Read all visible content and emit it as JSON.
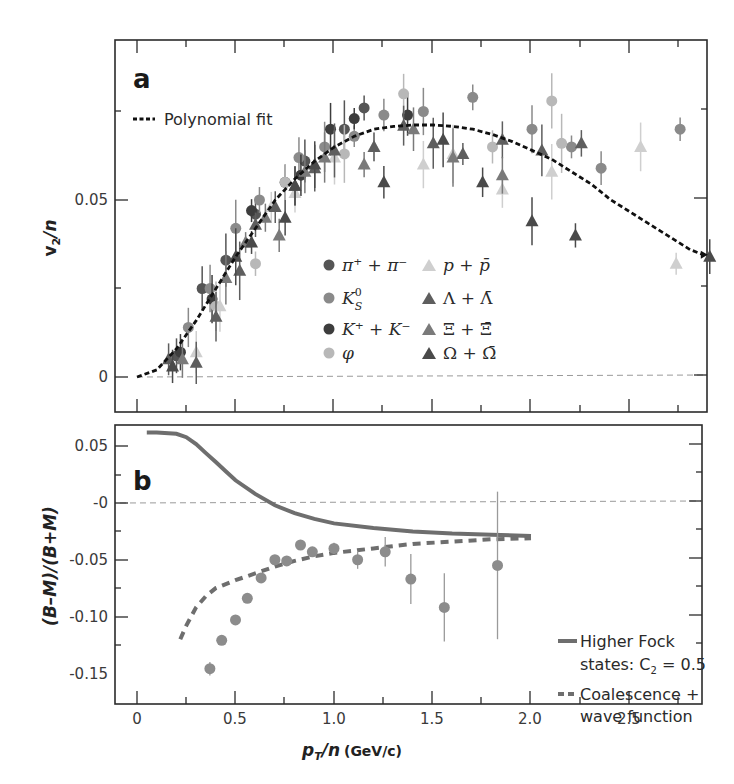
{
  "chart_data": [
    {
      "panel": "a",
      "type": "scatter",
      "xlabel": "p_T/n (GeV/c)",
      "ylabel": "v_2/n",
      "xlim": [
        -0.1,
        2.9
      ],
      "ylim": [
        -0.01,
        0.09
      ],
      "xticks": [
        0,
        0.5,
        1.0,
        1.5,
        2.0,
        2.5
      ],
      "yticks": [
        0,
        0.05
      ],
      "ytick_labels": [
        "0",
        "0.05"
      ],
      "zero_line": true,
      "fit": {
        "name": "Polynomial fit",
        "style": "dotted-black",
        "x": [
          0.0,
          0.1,
          0.2,
          0.3,
          0.4,
          0.5,
          0.6,
          0.7,
          0.8,
          0.9,
          1.0,
          1.1,
          1.2,
          1.3,
          1.4,
          1.5,
          1.6,
          1.7,
          1.8,
          1.9,
          2.0,
          2.1,
          2.2,
          2.3,
          2.4,
          2.5,
          2.6,
          2.7,
          2.8,
          2.87
        ],
        "y": [
          0.0,
          0.002,
          0.008,
          0.016,
          0.025,
          0.034,
          0.042,
          0.05,
          0.056,
          0.061,
          0.065,
          0.068,
          0.07,
          0.0708,
          0.0712,
          0.0712,
          0.0708,
          0.07,
          0.0685,
          0.0665,
          0.064,
          0.0615,
          0.058,
          0.0545,
          0.05,
          0.0465,
          0.043,
          0.0395,
          0.036,
          0.0345
        ]
      },
      "series": [
        {
          "name": "π+ + π−",
          "marker": "circle",
          "color": "#555555",
          "points": [
            [
              0.2,
              0.006
            ],
            [
              0.33,
              0.025
            ],
            [
              0.45,
              0.033
            ],
            [
              0.6,
              0.046
            ],
            [
              0.75,
              0.055
            ],
            [
              0.85,
              0.061
            ],
            [
              1.05,
              0.07
            ],
            [
              1.15,
              0.076
            ]
          ]
        },
        {
          "name": "K0S",
          "marker": "circle",
          "color": "#8a8a8a",
          "points": [
            [
              0.26,
              0.014
            ],
            [
              0.37,
              0.025
            ],
            [
              0.5,
              0.042
            ],
            [
              0.62,
              0.05
            ],
            [
              0.82,
              0.062
            ],
            [
              0.95,
              0.065
            ],
            [
              1.1,
              0.068
            ],
            [
              1.25,
              0.074
            ],
            [
              1.45,
              0.075
            ],
            [
              1.7,
              0.079
            ],
            [
              2.0,
              0.07
            ],
            [
              2.2,
              0.065
            ],
            [
              2.35,
              0.059
            ],
            [
              2.75,
              0.07
            ]
          ]
        },
        {
          "name": "K+ + K−",
          "marker": "circle",
          "color": "#3d3d3d",
          "points": [
            [
              0.22,
              0.007
            ],
            [
              0.38,
              0.022
            ],
            [
              0.58,
              0.047
            ],
            [
              0.83,
              0.057
            ],
            [
              0.98,
              0.07
            ],
            [
              1.1,
              0.073
            ],
            [
              1.37,
              0.074
            ]
          ]
        },
        {
          "name": "φ",
          "marker": "circle",
          "color": "#b8b8b8",
          "points": [
            [
              0.4,
              0.02
            ],
            [
              0.6,
              0.032
            ],
            [
              0.75,
              0.055
            ],
            [
              1.05,
              0.063
            ],
            [
              1.35,
              0.08
            ],
            [
              1.8,
              0.065
            ],
            [
              2.1,
              0.078
            ],
            [
              2.15,
              0.066
            ]
          ]
        },
        {
          "name": "p + p̄",
          "marker": "triangle",
          "color": "#cfcfcf",
          "points": [
            [
              0.3,
              0.007
            ],
            [
              0.42,
              0.02
            ],
            [
              0.68,
              0.048
            ],
            [
              0.8,
              0.052
            ],
            [
              1.0,
              0.062
            ],
            [
              1.2,
              0.065
            ],
            [
              1.45,
              0.06
            ],
            [
              1.6,
              0.063
            ],
            [
              1.85,
              0.053
            ],
            [
              2.1,
              0.058
            ],
            [
              2.55,
              0.065
            ],
            [
              2.73,
              0.032
            ]
          ]
        },
        {
          "name": "Λ + Λ̄",
          "marker": "triangle",
          "color": "#5e5e5e",
          "points": [
            [
              0.16,
              0.005
            ],
            [
              0.3,
              0.004
            ],
            [
              0.4,
              0.017
            ],
            [
              0.52,
              0.03
            ],
            [
              0.6,
              0.043
            ],
            [
              0.7,
              0.048
            ],
            [
              0.8,
              0.054
            ],
            [
              0.9,
              0.059
            ],
            [
              1.0,
              0.064
            ],
            [
              1.2,
              0.065
            ],
            [
              1.35,
              0.071
            ],
            [
              1.5,
              0.066
            ],
            [
              1.65,
              0.063
            ],
            [
              1.85,
              0.067
            ],
            [
              2.05,
              0.064
            ],
            [
              2.25,
              0.066
            ]
          ]
        },
        {
          "name": "Ξ + Ξ̄",
          "marker": "triangle",
          "color": "#7a7a7a",
          "points": [
            [
              0.23,
              0.005
            ],
            [
              0.45,
              0.028
            ],
            [
              0.55,
              0.038
            ],
            [
              0.65,
              0.045
            ],
            [
              0.72,
              0.04
            ],
            [
              0.85,
              0.058
            ],
            [
              0.95,
              0.062
            ],
            [
              1.15,
              0.06
            ],
            [
              1.4,
              0.07
            ],
            [
              1.6,
              0.062
            ],
            [
              1.85,
              0.057
            ]
          ]
        },
        {
          "name": "Ω + Ω̄",
          "marker": "triangle",
          "color": "#4a4a4a",
          "points": [
            [
              0.18,
              0.003
            ],
            [
              0.5,
              0.034
            ],
            [
              0.58,
              0.038
            ],
            [
              0.75,
              0.045
            ],
            [
              0.8,
              0.054
            ],
            [
              0.9,
              0.06
            ],
            [
              1.25,
              0.055
            ],
            [
              1.55,
              0.067
            ],
            [
              1.75,
              0.055
            ],
            [
              2.0,
              0.044
            ],
            [
              2.22,
              0.04
            ],
            [
              2.9,
              0.034
            ]
          ]
        }
      ]
    },
    {
      "panel": "b",
      "type": "scatter",
      "xlabel": "p_T/n (GeV/c)",
      "ylabel": "(B−M)/(B+M)",
      "xlim": [
        -0.1,
        2.9
      ],
      "ylim": [
        -0.15,
        0.065
      ],
      "xticks": [
        0,
        0.5,
        1.0,
        1.5,
        2.0,
        2.5
      ],
      "xtick_labels": [
        "0",
        "0.5",
        "1.0",
        "1.5",
        "2.0",
        "2.5"
      ],
      "yticks": [
        0.05,
        0,
        -0.05,
        -0.1,
        -0.15
      ],
      "ytick_labels": [
        "0.05",
        "-0",
        "-0.05",
        "-0.10",
        "-0.15"
      ],
      "zero_line": true,
      "data": {
        "marker": "circle",
        "color": "#8c8c8c",
        "points": [
          {
            "x": 0.37,
            "y": -0.146,
            "err": 0.006
          },
          {
            "x": 0.43,
            "y": -0.121,
            "err": 0.004
          },
          {
            "x": 0.5,
            "y": -0.103,
            "err": 0.002
          },
          {
            "x": 0.56,
            "y": -0.084,
            "err": 0.002
          },
          {
            "x": 0.63,
            "y": -0.066,
            "err": 0.002
          },
          {
            "x": 0.7,
            "y": -0.05,
            "err": 0.002
          },
          {
            "x": 0.76,
            "y": -0.051,
            "err": 0.002
          },
          {
            "x": 0.83,
            "y": -0.037,
            "err": 0.004
          },
          {
            "x": 0.89,
            "y": -0.043,
            "err": 0.004
          },
          {
            "x": 1.0,
            "y": -0.04,
            "err": 0.005
          },
          {
            "x": 1.12,
            "y": -0.05,
            "err": 0.008
          },
          {
            "x": 1.26,
            "y": -0.043,
            "err": 0.013
          },
          {
            "x": 1.39,
            "y": -0.067,
            "err": 0.022
          },
          {
            "x": 1.56,
            "y": -0.092,
            "err": 0.03
          },
          {
            "x": 1.83,
            "y": -0.055,
            "err": 0.065
          }
        ]
      },
      "curves": [
        {
          "name": "Higher Fock states: C2 = 0.5",
          "style": "solid-gray",
          "color": "#6e6e6e",
          "x": [
            0.05,
            0.1,
            0.2,
            0.25,
            0.3,
            0.35,
            0.4,
            0.45,
            0.5,
            0.6,
            0.7,
            0.8,
            0.9,
            1.0,
            1.2,
            1.4,
            1.6,
            1.8,
            2.0
          ],
          "y": [
            0.062,
            0.062,
            0.061,
            0.058,
            0.052,
            0.044,
            0.036,
            0.028,
            0.02,
            0.008,
            -0.002,
            -0.009,
            -0.014,
            -0.018,
            -0.022,
            -0.025,
            -0.027,
            -0.028,
            -0.029
          ]
        },
        {
          "name": "Coalescence + wave function",
          "style": "dashed-gray",
          "color": "#6e6e6e",
          "x": [
            0.22,
            0.25,
            0.3,
            0.35,
            0.4,
            0.5,
            0.6,
            0.7,
            0.8,
            0.9,
            1.0,
            1.2,
            1.4,
            1.6,
            1.8,
            2.0
          ],
          "y": [
            -0.12,
            -0.108,
            -0.092,
            -0.082,
            -0.075,
            -0.068,
            -0.062,
            -0.056,
            -0.051,
            -0.047,
            -0.044,
            -0.04,
            -0.036,
            -0.034,
            -0.032,
            -0.031
          ]
        }
      ]
    }
  ],
  "panel_a": {
    "letter": "a",
    "ylabel_main": "v",
    "ylabel_sub": "2",
    "ylabel_rest": "/n",
    "yticks": [
      "0.05",
      "0"
    ],
    "fit_legend": "Polynomial fit",
    "legend": {
      "pi": "π⁺ + π⁻",
      "k0s": "K",
      "k0s_sup": "0",
      "k0s_sub": "S",
      "kpm": "K⁺ + K⁻",
      "phi": "φ",
      "p": "p + p̄",
      "lambda": "Λ + Λ̄",
      "xi": "Ξ + Ξ̄",
      "omega": "Ω + Ω̄"
    }
  },
  "panel_b": {
    "letter": "b",
    "ylabel": "(B–M)/(B+M)",
    "yticks": [
      "0.05",
      "-0",
      "-0.05",
      "-0.10",
      "-0.15"
    ],
    "xticks": [
      "0",
      "0.5",
      "1.0",
      "1.5",
      "2.0",
      "2.5"
    ],
    "legend": {
      "fock_line1": "Higher Fock",
      "fock_line2": "states: C",
      "fock_sub": "2",
      "fock_val": " = 0.5",
      "coal_line1": "Coalescence +",
      "coal_line2": "wave function"
    }
  },
  "xaxis": {
    "label_main": "p",
    "label_sub": "T",
    "label_rest": "/n",
    "label_unit": "(GeV/c)"
  },
  "colors": {
    "frame": "#2b2b2b",
    "fit": "#111111",
    "curve": "#6e6e6e",
    "zero_line": "#9a9a9a"
  }
}
